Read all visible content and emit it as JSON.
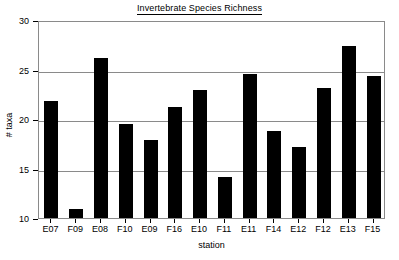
{
  "chart_data": {
    "type": "bar",
    "title": "Invertebrate Species Richness",
    "xlabel": "station",
    "ylabel": "# taxa",
    "categories": [
      "E07",
      "F09",
      "E08",
      "F10",
      "E09",
      "F16",
      "E10",
      "F11",
      "E11",
      "F14",
      "E12",
      "F12",
      "E13",
      "F15"
    ],
    "values": [
      21.8,
      10.9,
      26.2,
      19.5,
      17.9,
      21.2,
      22.9,
      14.1,
      24.5,
      18.8,
      17.2,
      23.1,
      27.4,
      24.3
    ],
    "ylim": [
      10,
      30
    ],
    "yticks": [
      10,
      15,
      20,
      25,
      30
    ],
    "ytick_labels": [
      "10",
      "15",
      "20",
      "25",
      "30"
    ],
    "grid": true,
    "grid_axis": "y",
    "legend": false,
    "bar_color": "#000000",
    "axis_color": "#8a8a8a",
    "text_color": "#000000",
    "background": "#ffffff"
  }
}
